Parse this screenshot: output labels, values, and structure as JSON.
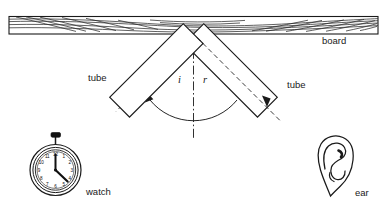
{
  "figure": {
    "labels": {
      "board": "board",
      "tube_left": "tube",
      "tube_right": "tube",
      "watch": "watch",
      "ear": "ear",
      "angle_incidence": "i",
      "angle_reflection": "r"
    },
    "watch": {
      "dial_numbers": [
        "12",
        "1",
        "2",
        "3",
        "4",
        "5",
        "6",
        "7",
        "8",
        "9",
        "10",
        "11"
      ]
    },
    "colors": {
      "ink": "#1a1a1a",
      "grain": "#2b2b2b",
      "paper": "#ffffff",
      "crown": "#111111"
    }
  }
}
